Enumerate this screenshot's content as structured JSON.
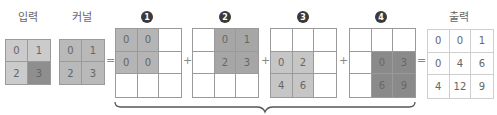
{
  "labels": {
    "input": "입력",
    "kernel": "커널",
    "output": "출력"
  },
  "colors": {
    "input_light": "#cbcbcb",
    "input_dark": "#8e8e8e",
    "kernel": "#b9b9b9",
    "step1": "#b5b5b5",
    "step2": "#a6a6a6",
    "step3": "#c6c6c6",
    "step4": "#8a8a8a"
  },
  "input": {
    "values": [
      "0",
      "1",
      "2",
      "3"
    ],
    "shade": [
      "light",
      "light",
      "light",
      "dark"
    ]
  },
  "kernel": {
    "values": [
      "0",
      "1",
      "2",
      "3"
    ]
  },
  "steps": [
    {
      "badge": "1",
      "values": [
        "0",
        "0",
        "",
        "0",
        "0",
        "",
        "",
        "",
        ""
      ],
      "shaded": [
        0,
        1,
        3,
        4
      ]
    },
    {
      "badge": "2",
      "values": [
        "",
        "0",
        "1",
        "",
        "2",
        "3",
        "",
        "",
        ""
      ],
      "shaded": [
        1,
        2,
        4,
        5
      ]
    },
    {
      "badge": "3",
      "values": [
        "",
        "",
        "",
        "0",
        "2",
        "",
        "4",
        "6",
        ""
      ],
      "shaded": [
        3,
        4,
        6,
        7
      ]
    },
    {
      "badge": "4",
      "values": [
        "",
        "",
        "",
        "",
        "0",
        "3",
        "",
        "6",
        "9"
      ],
      "shaded": [
        4,
        5,
        7,
        8
      ]
    }
  ],
  "output": {
    "values": [
      "0",
      "0",
      "1",
      "0",
      "4",
      "6",
      "4",
      "12",
      "9"
    ]
  },
  "operators": {
    "equals": "=",
    "plus": "+"
  }
}
